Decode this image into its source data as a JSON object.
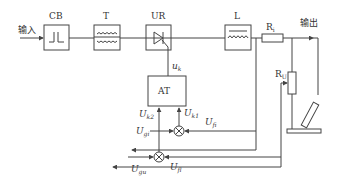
{
  "diagram": {
    "input_label": "输入",
    "output_label": "输出",
    "blocks": {
      "cb": "CB",
      "t": "T",
      "ur": "UR",
      "l": "L",
      "at": "AT"
    },
    "resistors": {
      "ri": {
        "label": "R",
        "sub": "i"
      },
      "ru": {
        "label": "R",
        "sub": "U"
      }
    },
    "signals": {
      "uk": {
        "label": "u",
        "sub": "k"
      },
      "uk2": {
        "label": "U",
        "sub": "k2"
      },
      "uk1": {
        "label": "U",
        "sub": "k1"
      },
      "ugi": {
        "label": "U",
        "sub": "gi"
      },
      "ufi": {
        "label": "U",
        "sub": "fi"
      },
      "ugu": {
        "label": "U",
        "sub": "gu"
      },
      "ufu": {
        "label": "U",
        "sub": "fl"
      }
    },
    "colors": {
      "line": "#444444",
      "background": "#ffffff"
    }
  }
}
